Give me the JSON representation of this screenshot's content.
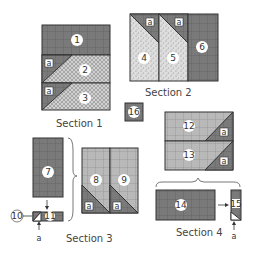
{
  "diagram": {
    "type": "quilt-block-assembly",
    "colors": {
      "dark": "#7a7a7a",
      "medium": "#a8a8a8",
      "light_check": "#c4c4c4",
      "speckle": "#d8d8d8",
      "outline": "#333333"
    },
    "sections": [
      {
        "label": "Section 1",
        "pieces": [
          "1",
          "2",
          "3"
        ],
        "corner_labels": [
          "a",
          "a"
        ]
      },
      {
        "label": "Section 2",
        "pieces": [
          "4",
          "5",
          "6"
        ],
        "corner_labels": [
          "a",
          "a"
        ]
      },
      {
        "label": "Section 3",
        "pieces": [
          "7",
          "8",
          "9",
          "10",
          "11"
        ],
        "corner_labels": [
          "a",
          "a",
          "a"
        ]
      },
      {
        "label": "Section 4",
        "pieces": [
          "14",
          "15"
        ],
        "corner_labels": [
          "a"
        ]
      }
    ],
    "standalone": [
      {
        "piece": "16"
      },
      {
        "pieces": [
          "12",
          "13"
        ],
        "corner_labels": [
          "a",
          "a"
        ]
      }
    ],
    "labels": {
      "s1": "Section 1",
      "s2": "Section 2",
      "s3": "Section 3",
      "s4": "Section 4",
      "p1": "1",
      "p2": "2",
      "p3": "3",
      "p4": "4",
      "p5": "5",
      "p6": "6",
      "p7": "7",
      "p8": "8",
      "p9": "9",
      "p10": "10",
      "p11": "11",
      "p12": "12",
      "p13": "13",
      "p14": "14",
      "p15": "15",
      "p16": "16",
      "a": "a"
    }
  }
}
